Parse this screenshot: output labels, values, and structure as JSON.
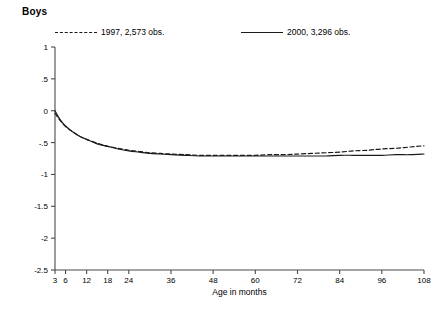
{
  "chart_data": {
    "type": "line",
    "title": "Boys",
    "xlabel": "Age in months",
    "ylabel": "",
    "xlim": [
      3,
      108
    ],
    "ylim": [
      -2.5,
      1
    ],
    "grid": false,
    "legend_position": "top",
    "x_ticks": [
      3,
      6,
      12,
      18,
      24,
      36,
      48,
      60,
      72,
      84,
      96,
      108
    ],
    "x_ticklabels": [
      "3",
      "6",
      "12",
      "18",
      "24",
      "36",
      "48",
      "60",
      "72",
      "84",
      "96",
      "108"
    ],
    "y_ticks": [
      1,
      0.5,
      0,
      -0.5,
      -1,
      -1.5,
      -2,
      -2.5
    ],
    "y_ticklabels": [
      "1",
      ".5",
      "0",
      "-.5",
      "-1",
      "-1.5",
      "-2",
      "-2.5"
    ],
    "series": [
      {
        "name": "1997, 2,573 obs.",
        "year": "1997",
        "obs": "2,573",
        "style": "dashed",
        "color": "#1a1a1a",
        "x": [
          3,
          4,
          5,
          6,
          8,
          10,
          12,
          15,
          18,
          21,
          24,
          27,
          30,
          33,
          36,
          40,
          44,
          48,
          52,
          56,
          60,
          64,
          68,
          72,
          76,
          80,
          84,
          88,
          92,
          96,
          100,
          104,
          108
        ],
        "y": [
          -0.04,
          -0.12,
          -0.19,
          -0.25,
          -0.33,
          -0.4,
          -0.45,
          -0.51,
          -0.56,
          -0.59,
          -0.62,
          -0.64,
          -0.66,
          -0.67,
          -0.68,
          -0.69,
          -0.7,
          -0.7,
          -0.7,
          -0.7,
          -0.7,
          -0.69,
          -0.69,
          -0.68,
          -0.67,
          -0.66,
          -0.65,
          -0.63,
          -0.62,
          -0.6,
          -0.59,
          -0.57,
          -0.55
        ]
      },
      {
        "name": "2000, 3,296 obs.",
        "year": "2000",
        "obs": "3,296",
        "style": "solid",
        "color": "#1a1a1a",
        "x": [
          3,
          4,
          5,
          6,
          8,
          10,
          12,
          15,
          18,
          21,
          24,
          27,
          30,
          33,
          36,
          40,
          44,
          48,
          52,
          56,
          60,
          64,
          68,
          72,
          76,
          80,
          84,
          88,
          92,
          96,
          100,
          104,
          108
        ],
        "y": [
          0.0,
          -0.1,
          -0.18,
          -0.24,
          -0.33,
          -0.4,
          -0.45,
          -0.52,
          -0.56,
          -0.6,
          -0.63,
          -0.65,
          -0.67,
          -0.68,
          -0.69,
          -0.7,
          -0.71,
          -0.71,
          -0.71,
          -0.71,
          -0.71,
          -0.71,
          -0.71,
          -0.71,
          -0.71,
          -0.71,
          -0.7,
          -0.7,
          -0.7,
          -0.7,
          -0.69,
          -0.69,
          -0.68
        ]
      }
    ]
  },
  "legend": {
    "entries": [
      {
        "label": "1997, 2,573 obs."
      },
      {
        "label": "2000, 3,296 obs."
      }
    ]
  }
}
